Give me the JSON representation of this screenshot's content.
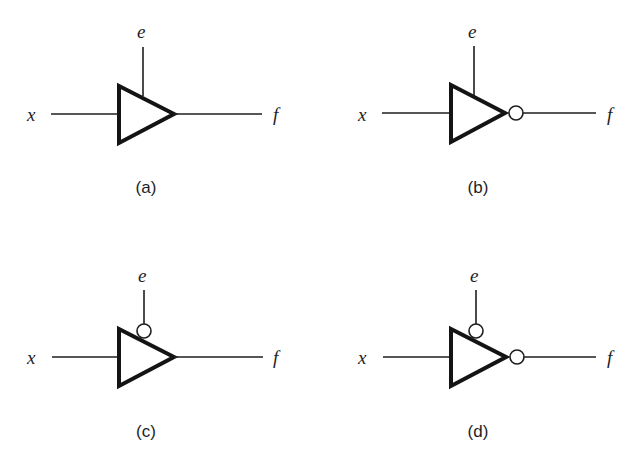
{
  "figure": {
    "panels": [
      {
        "id": "a",
        "caption": "(a)",
        "input_label": "x",
        "enable_label": "e",
        "output_label": "f",
        "enable_inverted": false,
        "output_inverted": false,
        "description": "Tri-state buffer, active-high enable"
      },
      {
        "id": "b",
        "caption": "(b)",
        "input_label": "x",
        "enable_label": "e",
        "output_label": "f",
        "enable_inverted": false,
        "output_inverted": true,
        "description": "Tri-state inverter, active-high enable"
      },
      {
        "id": "c",
        "caption": "(c)",
        "input_label": "x",
        "enable_label": "e",
        "output_label": "f",
        "enable_inverted": true,
        "output_inverted": false,
        "description": "Tri-state buffer, active-low enable"
      },
      {
        "id": "d",
        "caption": "(d)",
        "input_label": "x",
        "enable_label": "e",
        "output_label": "f",
        "enable_inverted": true,
        "output_inverted": true,
        "description": "Tri-state inverter, active-low enable"
      }
    ]
  },
  "colors": {
    "background": "#ffffff",
    "stroke": "#1e1e1e"
  }
}
